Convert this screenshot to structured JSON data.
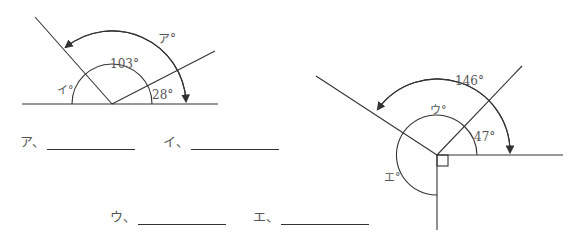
{
  "figure_left": {
    "labels": {
      "a": "ア°",
      "i": "イ°",
      "angle_103": "103°",
      "angle_28": "28°"
    }
  },
  "figure_right": {
    "labels": {
      "u": "ウ°",
      "e": "エ°",
      "angle_146": "146°",
      "angle_47": "47°"
    }
  },
  "answers": [
    {
      "label": "ア、",
      "value": ""
    },
    {
      "label": "イ、",
      "value": ""
    },
    {
      "label": "ウ、",
      "value": ""
    },
    {
      "label": "エ、",
      "value": ""
    }
  ]
}
